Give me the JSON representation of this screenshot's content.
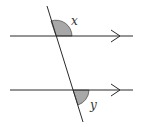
{
  "diagram": {
    "colors": {
      "line": "#2a2a2a",
      "angle_fill": "#a8a8a8",
      "label": "#333333",
      "background": "#ffffff"
    },
    "parallel_lines": [
      {
        "id": "top",
        "x1": 10,
        "y1": 36,
        "x2": 133,
        "y2": 36,
        "arrow_tip_x": 120
      },
      {
        "id": "bottom",
        "x1": 10,
        "y1": 90,
        "x2": 133,
        "y2": 90,
        "arrow_tip_x": 120
      }
    ],
    "transversal": {
      "x1": 47,
      "y1": 6,
      "x2": 83,
      "y2": 122
    },
    "angles": [
      {
        "name": "x",
        "label": "x",
        "position": "upper-right of top intersection",
        "label_x": 71,
        "label_y": 25
      },
      {
        "name": "y",
        "label": "y",
        "position": "lower-right of bottom intersection",
        "label_x": 90,
        "label_y": 108
      }
    ]
  }
}
